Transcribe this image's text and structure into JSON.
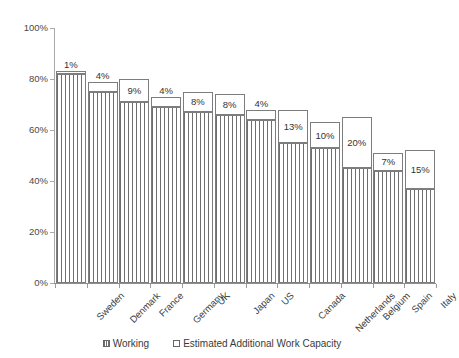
{
  "chart_data": {
    "type": "bar",
    "subtype": "stacked-column",
    "title": "",
    "xlabel": "",
    "ylabel": "",
    "ylim": [
      0,
      100
    ],
    "y_tick_labels": [
      "100%",
      "80%",
      "60%",
      "40%",
      "20%",
      "0%"
    ],
    "y_tick_values": [
      100,
      80,
      60,
      40,
      20,
      0
    ],
    "grid": false,
    "legend_position": "bottom",
    "categories": [
      "Sweden",
      "Denmark",
      "France",
      "Germany",
      "UK",
      "Japan",
      "US",
      "Canada",
      "Netherlands",
      "Belgium",
      "Spain",
      "Italy"
    ],
    "series": [
      {
        "name": "Working",
        "values": [
          82,
          75,
          71,
          69,
          67,
          66,
          64,
          55,
          53,
          45,
          44,
          37
        ]
      },
      {
        "name": "Estimated Additional Work Capacity",
        "values": [
          1,
          4,
          9,
          4,
          8,
          8,
          4,
          13,
          10,
          20,
          7,
          15
        ]
      }
    ],
    "data_labels": [
      "1%",
      "4%",
      "9%",
      "4%",
      "8%",
      "8%",
      "4%",
      "13%",
      "10%",
      "20%",
      "7%",
      "15%"
    ]
  },
  "legend": {
    "items": [
      {
        "label": "Working",
        "marker": "pattern-striped-swatch"
      },
      {
        "label": "Estimated Additional Work Capacity",
        "marker": "empty-swatch"
      }
    ]
  },
  "colors": {
    "bar_outline": "#7d7d7d",
    "stripe": "#6f6f6f",
    "capacity_fill": "#ffffff",
    "axis": "#8d8d8d",
    "text": "#3a3a3a",
    "background": "#ffffff"
  }
}
